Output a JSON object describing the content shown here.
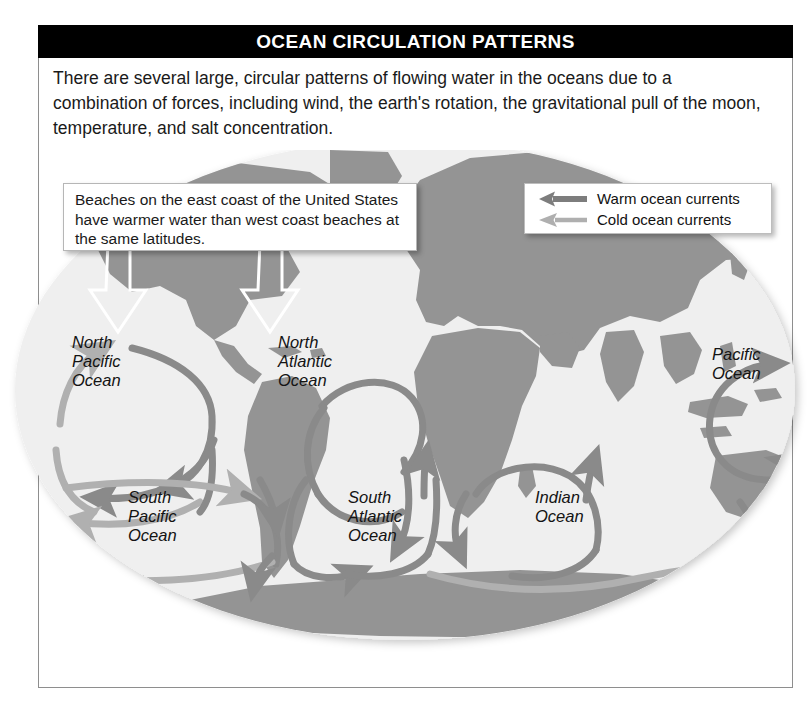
{
  "header": {
    "title": "OCEAN CIRCULATION PATTERNS"
  },
  "intro": {
    "paragraph": "There are several large, circular patterns of flowing water in the oceans due to a combination of forces, including wind, the earth's rotation, the gravitational pull of the moon, temperature, and salt concentration."
  },
  "callout": {
    "text": "Beaches on the east coast of the United States have warmer water than west coast beaches at the same latitudes."
  },
  "legend": {
    "items": [
      {
        "label": "Warm ocean currents",
        "icon": "left-arrow-icon",
        "color": "#7d7d7d",
        "weight": "thick"
      },
      {
        "label": "Cold ocean currents",
        "icon": "left-arrow-icon",
        "color": "#afafaf",
        "weight": "thin"
      }
    ]
  },
  "map": {
    "ocean_color": "#efefef",
    "land_color": "#949494",
    "warm_current_color": "#8a8a8a",
    "cold_current_color": "#b0b0b0",
    "labels": [
      {
        "name": "north-pacific-ocean",
        "text": "North\nPacific\nOcean",
        "x": 72,
        "y": 333
      },
      {
        "name": "north-atlantic-ocean",
        "text": "North\nAtlantic\nOcean",
        "x": 278,
        "y": 333
      },
      {
        "name": "pacific-ocean-right",
        "text": "Pacific\nOcean",
        "x": 712,
        "y": 345
      },
      {
        "name": "south-pacific-ocean",
        "text": "South\nPacific\nOcean",
        "x": 128,
        "y": 488
      },
      {
        "name": "south-atlantic-ocean",
        "text": "South\nAtlantic\nOcean",
        "x": 348,
        "y": 488
      },
      {
        "name": "indian-ocean",
        "text": "Indian\nOcean",
        "x": 535,
        "y": 488
      }
    ]
  }
}
